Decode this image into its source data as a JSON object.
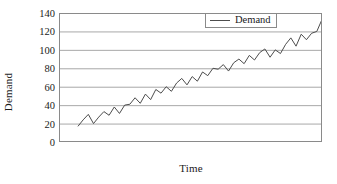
{
  "chart_data": {
    "type": "line",
    "title": "",
    "xlabel": "Time",
    "ylabel": "Demand",
    "ylim": [
      0,
      140
    ],
    "yticks": [
      0,
      20,
      40,
      60,
      80,
      100,
      120,
      140
    ],
    "ytick_labels": [
      "0",
      "20",
      "40",
      "60",
      "80",
      "100",
      "120",
      "140"
    ],
    "xticks": [],
    "xtick_labels": [],
    "grid": "horizontal",
    "legend_position": "top-right",
    "series": [
      {
        "name": "Demand",
        "color": "#4d4d4d",
        "x": [
          1,
          2,
          3,
          4,
          5,
          6,
          7,
          8,
          9,
          10,
          11,
          12,
          13,
          14,
          15,
          16,
          17,
          18,
          19,
          20,
          21,
          22,
          23,
          24,
          25,
          26,
          27,
          28,
          29,
          30,
          31,
          32,
          33,
          34,
          35,
          36,
          37,
          38,
          39,
          40,
          41,
          42,
          43,
          44,
          45,
          46,
          47,
          48
        ],
        "values": [
          17,
          24,
          30,
          20,
          27,
          33,
          29,
          38,
          31,
          40,
          41,
          48,
          42,
          52,
          46,
          57,
          53,
          60,
          55,
          64,
          69,
          62,
          71,
          66,
          76,
          72,
          80,
          79,
          84,
          77,
          86,
          90,
          85,
          94,
          89,
          97,
          101,
          92,
          100,
          96,
          106,
          113,
          104,
          117,
          111,
          118,
          120,
          133
        ]
      }
    ]
  },
  "legend": {
    "entries": [
      {
        "label": "Demand"
      }
    ]
  },
  "axes": {
    "x_title": "Time",
    "y_title": "Demand"
  }
}
